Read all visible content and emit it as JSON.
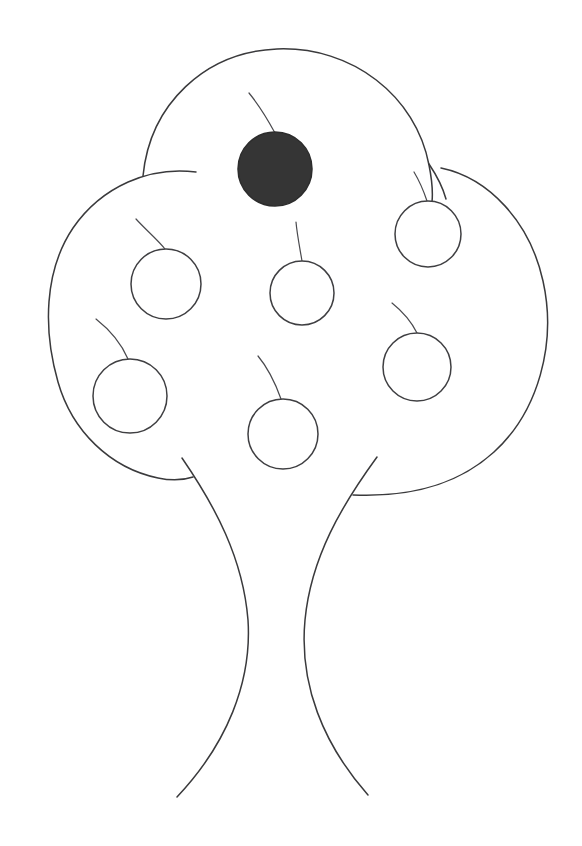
{
  "scene": {
    "title": "Tree with fruits line drawing",
    "width": 582,
    "height": 846,
    "background_color": "#ffffff",
    "ink_color": "#3a3a3c",
    "filled_fruit_color": "#353535",
    "style": "hand-drawn monochrome outline sketch"
  },
  "canopy": {
    "label": "Tree canopy",
    "lobe_count": 3,
    "lobes": [
      {
        "name": "top-lobe",
        "center_x": 288,
        "center_y": 196,
        "radius_x": 148,
        "radius_y": 146
      },
      {
        "name": "left-lobe",
        "center_x": 178,
        "center_y": 322,
        "radius_x": 130,
        "radius_y": 160
      },
      {
        "name": "right-lobe",
        "center_x": 398,
        "center_y": 330,
        "radius_x": 152,
        "radius_y": 168
      }
    ]
  },
  "trunk": {
    "label": "Tree trunk",
    "left_top_x": 182,
    "left_top_y": 458,
    "left_bottom_x": 177,
    "left_bottom_y": 797,
    "right_top_x": 377,
    "right_top_y": 457,
    "right_bottom_x": 368,
    "right_bottom_y": 795,
    "narrowest_y": 620,
    "narrow_left_x": 248,
    "narrow_right_x": 305
  },
  "fruits": {
    "label": "Fruits on the tree",
    "total": 7,
    "filled_count": 1,
    "outlined_count": 6,
    "items": [
      {
        "id": "fruit-1",
        "position": "top-center",
        "cx": 275,
        "cy": 169,
        "r": 37,
        "filled": true,
        "fill_color": "#353535",
        "stem_path": "M 275 133 C 268 120 258 104 249 93"
      },
      {
        "id": "fruit-2",
        "position": "upper-left",
        "cx": 166,
        "cy": 284,
        "r": 35,
        "filled": false,
        "fill_color": "#ffffff",
        "stem_path": "M 165 249 C 158 240 146 230 136 219"
      },
      {
        "id": "fruit-3",
        "position": "middle-center",
        "cx": 302,
        "cy": 293,
        "r": 32,
        "filled": false,
        "fill_color": "#ffffff",
        "stem_path": "M 302 261 C 300 249 297 234 296 222"
      },
      {
        "id": "fruit-4",
        "position": "upper-right",
        "cx": 428,
        "cy": 234,
        "r": 33,
        "filled": false,
        "fill_color": "#ffffff",
        "stem_path": "M 427 201 C 424 192 420 182 414 172"
      },
      {
        "id": "fruit-5",
        "position": "lower-left",
        "cx": 130,
        "cy": 396,
        "r": 37,
        "filled": false,
        "fill_color": "#ffffff",
        "stem_path": "M 128 359 C 122 345 110 330 96 319"
      },
      {
        "id": "fruit-6",
        "position": "lower-center",
        "cx": 283,
        "cy": 434,
        "r": 35,
        "filled": false,
        "fill_color": "#ffffff",
        "stem_path": "M 281 399 C 276 385 268 368 258 356"
      },
      {
        "id": "fruit-7",
        "position": "lower-right",
        "cx": 417,
        "cy": 367,
        "r": 34,
        "filled": false,
        "fill_color": "#ffffff",
        "stem_path": "M 417 333 C 412 323 402 311 392 303"
      }
    ]
  }
}
